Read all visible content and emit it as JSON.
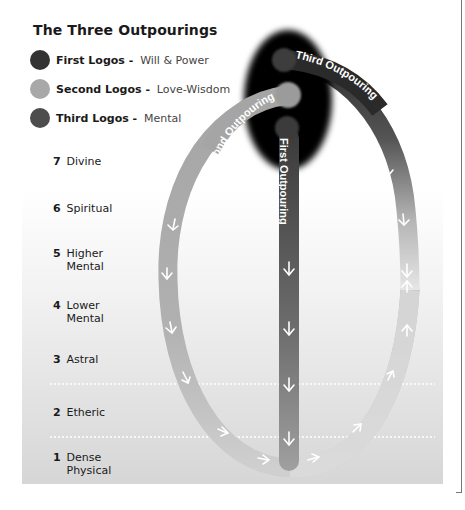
{
  "title": "The Three Outpourings",
  "legend": [
    {
      "name": "First Logos",
      "separator": " - ",
      "description": "Will & Power",
      "color": "#333333",
      "icon": "circle-dot-dark"
    },
    {
      "name": "Second Logos",
      "separator": " - ",
      "description": "Love-Wisdom",
      "color": "#a8a8a8",
      "icon": "circle-dot-light"
    },
    {
      "name": "Third Logos",
      "separator": " - ",
      "description": "Mental",
      "color": "#4d4d4d",
      "icon": "circle-dot-medium"
    }
  ],
  "planes": [
    {
      "number": "7",
      "name": "Divine"
    },
    {
      "number": "6",
      "name": "Spiritual"
    },
    {
      "number": "5",
      "name": "Higher\nMental"
    },
    {
      "number": "4",
      "name": "Lower\nMental"
    },
    {
      "number": "3",
      "name": "Astral"
    },
    {
      "number": "2",
      "name": "Etheric"
    },
    {
      "number": "1",
      "name": "Dense\nPhysical"
    }
  ],
  "outpourings": {
    "first": "First Outpouring",
    "second": "Second Outpouring",
    "third": "Third Outpouring"
  },
  "colors": {
    "ellipse": "#050505",
    "first_bar": "#4a4a4a",
    "second_arc": "#a6a6a6",
    "third_arc": "#3a3a3a",
    "panel_top": "#ffffff",
    "panel_bottom": "#d9d9d9"
  }
}
